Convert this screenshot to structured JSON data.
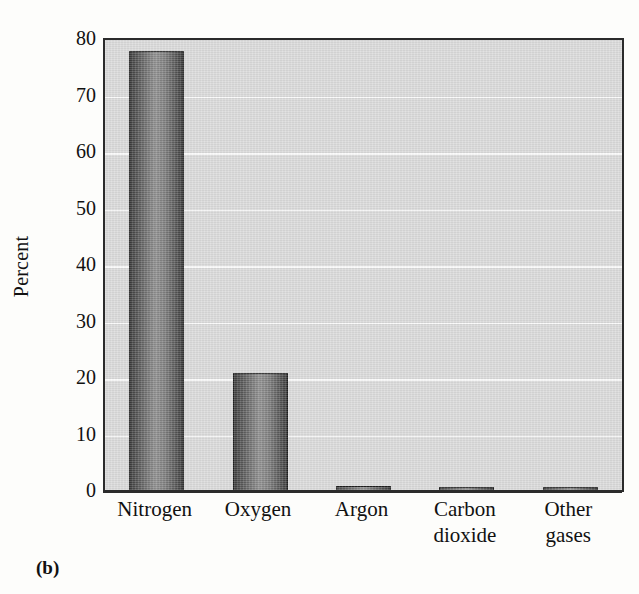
{
  "caption": "(b)",
  "chart_data": {
    "type": "bar",
    "title": "",
    "subtitle": "",
    "xlabel": "",
    "ylabel": "Percent",
    "categories": [
      "Nitrogen",
      "Oxygen",
      "Argon",
      "Carbon dioxide",
      "Other gases"
    ],
    "category_lines": [
      [
        "Nitrogen"
      ],
      [
        "Oxygen"
      ],
      [
        "Argon"
      ],
      [
        "Carbon",
        "dioxide"
      ],
      [
        "Other",
        "gases"
      ]
    ],
    "values": [
      78,
      21,
      1,
      0.4,
      0.4
    ],
    "ylim": [
      0,
      80
    ],
    "ytick_labels": [
      "0",
      "10",
      "20",
      "30",
      "40",
      "50",
      "60",
      "70",
      "80"
    ],
    "ytick_values": [
      0,
      10,
      20,
      30,
      40,
      50,
      60,
      70,
      80
    ],
    "grid": true,
    "legend": "none",
    "annotations": []
  },
  "style": {
    "plot_background": "#d9d9d9",
    "page_background": "#fdfdfb",
    "gridline_color": "#fbfbfb",
    "axis_color": "#2b2b2b",
    "bar_edge_color": "#1d1d1d",
    "bar_fill_dark": "#3b3b3b",
    "bar_fill_light": "#8e8e8e"
  }
}
